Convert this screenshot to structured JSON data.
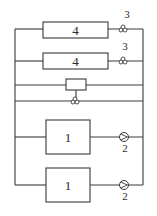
{
  "diagram": {
    "type": "parallel piping / flow schematic",
    "components": [
      {
        "id": "cooler-a",
        "label": "4",
        "valve_label": "3"
      },
      {
        "id": "cooler-b",
        "label": "4",
        "valve_label": "3"
      },
      {
        "id": "bypass-box",
        "label": ""
      },
      {
        "id": "bypass-valve",
        "label": ""
      },
      {
        "id": "unit-a",
        "label": "1",
        "pump_label": "2"
      },
      {
        "id": "unit-b",
        "label": "1",
        "pump_label": "2"
      }
    ]
  }
}
